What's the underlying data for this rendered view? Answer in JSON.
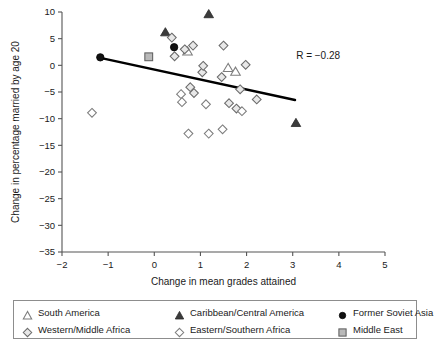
{
  "chart_data": {
    "type": "scatter",
    "title": "",
    "xlabel": "Change in mean grades attained",
    "ylabel": "Change in percentage married by age 20",
    "xlim": [
      -2,
      5
    ],
    "ylim": [
      -35,
      10
    ],
    "xticks": [
      "-2",
      "-1",
      "0",
      "1",
      "2",
      "3",
      "4",
      "5"
    ],
    "yticks": [
      "10",
      "5",
      "0",
      "-5",
      "-10",
      "-15",
      "-20",
      "-25",
      "-30",
      "-35"
    ],
    "grid": false,
    "legend_position": "below-axes",
    "annotations": [
      {
        "name": "correlation",
        "text": "R = −0.28",
        "x": 3.55,
        "y": 1.2
      }
    ],
    "trendline": {
      "name": "least-squares-fit",
      "x_start": -1.22,
      "y_start": 1.5,
      "x_end": 3.05,
      "y_end": -6.5,
      "color": "#000000"
    },
    "series": [
      {
        "name": "South America",
        "marker": "open-triangle",
        "color": "#ffffff",
        "edge": "#7d7d7d",
        "points": [
          {
            "x": 0.72,
            "y": 2.6
          },
          {
            "x": 1.6,
            "y": -0.5
          },
          {
            "x": 1.76,
            "y": -1.2
          }
        ]
      },
      {
        "name": "Caribbean/Central America",
        "marker": "filled-triangle",
        "color": "#3b3b3b",
        "edge": "#2a2a2a",
        "points": [
          {
            "x": 0.24,
            "y": 6.2
          },
          {
            "x": 1.18,
            "y": 9.6
          },
          {
            "x": 3.07,
            "y": -10.8
          }
        ]
      },
      {
        "name": "Former Soviet Asia",
        "marker": "filled-circle",
        "color": "#111111",
        "edge": "#000000",
        "points": [
          {
            "x": -1.17,
            "y": 1.5
          },
          {
            "x": 0.43,
            "y": 3.4
          }
        ]
      },
      {
        "name": "Western/Middle Africa",
        "marker": "shaded-diamond",
        "color": "#e8e8e8",
        "edge": "#6a6a6a",
        "points": [
          {
            "x": 0.38,
            "y": 5.2
          },
          {
            "x": 0.44,
            "y": 1.7
          },
          {
            "x": 0.66,
            "y": 3.0
          },
          {
            "x": 0.84,
            "y": 3.7
          },
          {
            "x": 1.04,
            "y": -1.3
          },
          {
            "x": 1.06,
            "y": -0.1
          },
          {
            "x": 1.46,
            "y": -2.2
          },
          {
            "x": 1.5,
            "y": 3.7
          },
          {
            "x": 1.86,
            "y": -4.5
          },
          {
            "x": 1.98,
            "y": 0.1
          },
          {
            "x": 0.78,
            "y": -4.1
          },
          {
            "x": 0.86,
            "y": -5.2
          },
          {
            "x": 1.62,
            "y": -7.1
          },
          {
            "x": 1.78,
            "y": -8.1
          },
          {
            "x": 2.22,
            "y": -6.4
          }
        ]
      },
      {
        "name": "Eastern/Southern Africa",
        "marker": "open-diamond",
        "color": "#ffffff",
        "edge": "#7d7d7d",
        "points": [
          {
            "x": -1.35,
            "y": -8.9
          },
          {
            "x": 0.58,
            "y": -5.4
          },
          {
            "x": 0.6,
            "y": -6.9
          },
          {
            "x": 0.74,
            "y": -12.8
          },
          {
            "x": 1.12,
            "y": -7.3
          },
          {
            "x": 1.18,
            "y": -12.8
          },
          {
            "x": 1.48,
            "y": -12.0
          },
          {
            "x": 1.9,
            "y": -8.6
          }
        ]
      },
      {
        "name": "Middle East",
        "marker": "grey-square",
        "color": "#b9b9b9",
        "edge": "#5e5e5e",
        "points": [
          {
            "x": -0.12,
            "y": 1.6
          }
        ]
      }
    ]
  },
  "legend": {
    "entries": [
      {
        "label": "South America",
        "marker": "open-triangle"
      },
      {
        "label": "Caribbean/Central America",
        "marker": "filled-triangle"
      },
      {
        "label": "Former Soviet Asia",
        "marker": "filled-circle"
      },
      {
        "label": "Western/Middle Africa",
        "marker": "shaded-diamond"
      },
      {
        "label": "Eastern/Southern Africa",
        "marker": "open-diamond"
      },
      {
        "label": "Middle East",
        "marker": "grey-square"
      }
    ]
  }
}
